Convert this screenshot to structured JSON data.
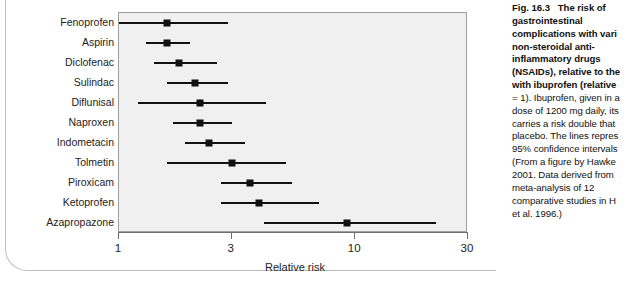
{
  "figure": {
    "axis_label": "Relative risk",
    "tick_labels": [
      "1",
      "3",
      "10",
      "30"
    ],
    "tick_values": [
      1,
      3,
      10,
      30
    ],
    "plot_bg": "#f0f0f0",
    "marker_color": "#111111"
  },
  "caption": {
    "label": "Fig. 16.3",
    "lines": [
      "The risk of",
      "gastrointestinal",
      "complications with vari",
      "non-steroidal anti-",
      "inflammatory drugs",
      "(NSAIDs), relative to the",
      "with ibuprofen (relative",
      "= 1). Ibuprofen, given in a",
      "dose of 1200 mg daily, its",
      "carries a risk double that",
      "placebo. The lines repres",
      "95% confidence intervals",
      "(From a figure by Hawke",
      "2001. Data derived from",
      "meta-analysis of 12",
      "comparative studies in H",
      "et al. 1996.)"
    ],
    "bold_line_count": 7
  },
  "chart_data": {
    "type": "forest",
    "xlabel": "Relative risk",
    "ylabel": "",
    "xscale": "log",
    "xlim": [
      1,
      30
    ],
    "xticks": [
      1,
      3,
      10,
      30
    ],
    "grid": false,
    "legend": "none",
    "reference_value": 1,
    "categories": [
      "Fenoprofen",
      "Aspirin",
      "Diclofenac",
      "Sulindac",
      "Diflunisal",
      "Naproxen",
      "Indometacin",
      "Tolmetin",
      "Piroxicam",
      "Ketoprofen",
      "Azapropazone"
    ],
    "values": [
      1.6,
      1.6,
      1.8,
      2.1,
      2.2,
      2.2,
      2.4,
      3.0,
      3.6,
      3.9,
      9.2
    ],
    "ci_low": [
      1.0,
      1.3,
      1.4,
      1.6,
      1.2,
      1.7,
      1.9,
      1.6,
      2.7,
      2.7,
      4.1
    ],
    "ci_high": [
      2.9,
      2.0,
      2.6,
      2.9,
      4.2,
      3.0,
      3.4,
      5.1,
      5.4,
      7.0,
      22.0
    ],
    "points": [
      {
        "label": "Fenoprofen",
        "value": 1.6,
        "ci_low": 1.0,
        "ci_high": 2.9
      },
      {
        "label": "Aspirin",
        "value": 1.6,
        "ci_low": 1.3,
        "ci_high": 2.0
      },
      {
        "label": "Diclofenac",
        "value": 1.8,
        "ci_low": 1.4,
        "ci_high": 2.6
      },
      {
        "label": "Sulindac",
        "value": 2.1,
        "ci_low": 1.6,
        "ci_high": 2.9
      },
      {
        "label": "Diflunisal",
        "value": 2.2,
        "ci_low": 1.2,
        "ci_high": 4.2
      },
      {
        "label": "Naproxen",
        "value": 2.2,
        "ci_low": 1.7,
        "ci_high": 3.0
      },
      {
        "label": "Indometacin",
        "value": 2.4,
        "ci_low": 1.9,
        "ci_high": 3.4
      },
      {
        "label": "Tolmetin",
        "value": 3.0,
        "ci_low": 1.6,
        "ci_high": 5.1
      },
      {
        "label": "Piroxicam",
        "value": 3.6,
        "ci_low": 2.7,
        "ci_high": 5.4
      },
      {
        "label": "Ketoprofen",
        "value": 3.9,
        "ci_low": 2.7,
        "ci_high": 7.0
      },
      {
        "label": "Azapropazone",
        "value": 9.2,
        "ci_low": 4.1,
        "ci_high": 22.0
      }
    ]
  }
}
